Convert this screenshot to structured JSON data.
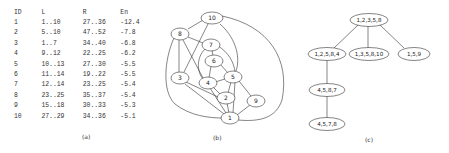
{
  "panel_a": {
    "caption": "(a)",
    "columns": [
      "ID",
      "L",
      "R",
      "En"
    ],
    "rows": [
      [
        "1",
        "1..10",
        "27..36",
        "-12.4"
      ],
      [
        "2",
        "5..10",
        "47..52",
        "-7.8"
      ],
      [
        "3",
        "1..7",
        "34..40",
        "-6.8"
      ],
      [
        "4",
        "9..12",
        "22..25",
        "-6.2"
      ],
      [
        "5",
        "10..13",
        "27..30",
        "-5.5"
      ],
      [
        "6",
        "11..14",
        "19..22",
        "-5.5"
      ],
      [
        "7",
        "12..14",
        "23..25",
        "-5.4"
      ],
      [
        "8",
        "23..25",
        "35..37",
        "-5.4"
      ],
      [
        "9",
        "15..18",
        "30..33",
        "-5.3"
      ],
      [
        "10",
        "27..29",
        "34..36",
        "-5.1"
      ]
    ]
  },
  "panel_b": {
    "caption": "(b)",
    "nodes": [
      {
        "id": "10",
        "label": "10"
      },
      {
        "id": "8",
        "label": "8"
      },
      {
        "id": "7",
        "label": "7"
      },
      {
        "id": "6",
        "label": "6"
      },
      {
        "id": "3",
        "label": "3"
      },
      {
        "id": "4",
        "label": "4"
      },
      {
        "id": "5",
        "label": "5"
      },
      {
        "id": "2",
        "label": "2"
      },
      {
        "id": "9",
        "label": "9"
      },
      {
        "id": "1",
        "label": "1"
      }
    ]
  },
  "panel_c": {
    "caption": "(c)",
    "nodes": [
      {
        "id": "root",
        "label": "1,2,3,5,8"
      },
      {
        "id": "c1",
        "label": "1,2,5,8,4"
      },
      {
        "id": "c2",
        "label": "1,3,5,8,10"
      },
      {
        "id": "c3",
        "label": "1,5,9"
      },
      {
        "id": "c4",
        "label": "4,5,8,7"
      },
      {
        "id": "c5",
        "label": "4,5,7,8"
      }
    ]
  }
}
